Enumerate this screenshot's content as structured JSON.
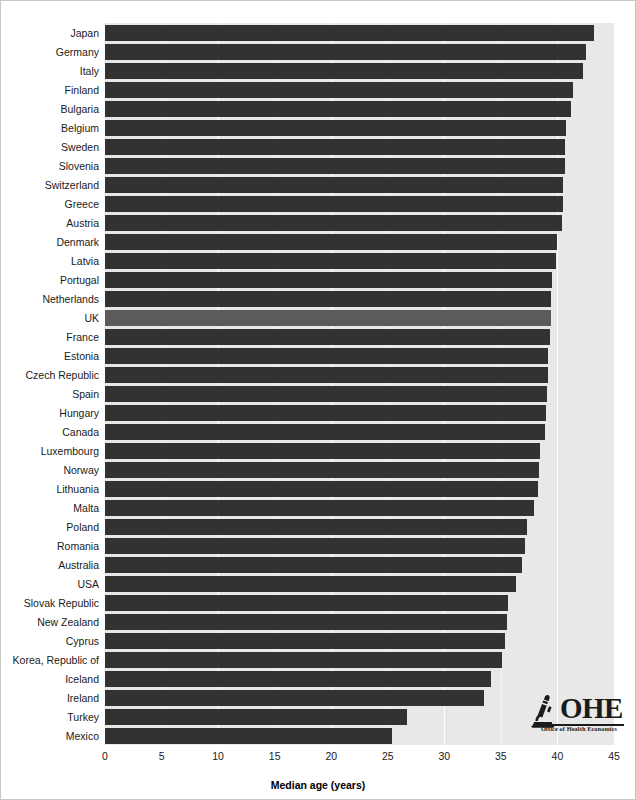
{
  "chart_data": {
    "type": "bar",
    "orientation": "horizontal",
    "title": "",
    "xlabel": "Median age (years)",
    "ylabel": "",
    "xlim": [
      0,
      45
    ],
    "xticks": [
      0,
      5,
      10,
      15,
      20,
      25,
      30,
      35,
      40,
      45
    ],
    "grid": true,
    "legend": null,
    "highlight_category": "UK",
    "colors": {
      "bar": "#323232",
      "bar_highlight": "#5b5b5b",
      "plot_background": "#e8e8e8",
      "gridline": "#ffffff"
    },
    "categories": [
      "Japan",
      "Germany",
      "Italy",
      "Finland",
      "Bulgaria",
      "Belgium",
      "Sweden",
      "Slovenia",
      "Switzerland",
      "Greece",
      "Austria",
      "Denmark",
      "Latvia",
      "Portugal",
      "Netherlands",
      "UK",
      "France",
      "Estonia",
      "Czech Republic",
      "Spain",
      "Hungary",
      "Canada",
      "Luxembourg",
      "Norway",
      "Lithuania",
      "Malta",
      "Poland",
      "Romania",
      "Australia",
      "USA",
      "Slovak Republic",
      "New Zealand",
      "Cyprus",
      "Korea, Republic of",
      "Iceland",
      "Ireland",
      "Turkey",
      "Mexico"
    ],
    "values": [
      43.2,
      42.5,
      42.3,
      41.4,
      41.2,
      40.8,
      40.7,
      40.7,
      40.5,
      40.5,
      40.4,
      40.0,
      39.9,
      39.5,
      39.4,
      39.4,
      39.3,
      39.2,
      39.2,
      39.1,
      39.0,
      38.9,
      38.5,
      38.4,
      38.3,
      37.9,
      37.3,
      37.1,
      36.9,
      36.3,
      35.6,
      35.5,
      35.4,
      35.1,
      34.1,
      33.5,
      26.7,
      25.4
    ]
  },
  "footer": {
    "logo_letters": "OHE",
    "logo_subtitle": "Office of Health Economics"
  }
}
